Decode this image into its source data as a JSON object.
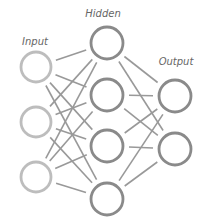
{
  "diagram": {
    "width": 205,
    "height": 224,
    "colors": {
      "background": "#ffffff",
      "label": "#666666",
      "edge": "#999999",
      "input_node_stroke": "#bdbdbd",
      "hidden_node_stroke": "#8a8a8a",
      "output_node_stroke": "#8a8a8a"
    },
    "layers": [
      {
        "id": "input",
        "label": "Input",
        "label_pos": {
          "x": 35,
          "y": 45
        },
        "node_radius": 15,
        "stroke_key": "input_node_stroke",
        "nodes": [
          {
            "x": 36,
            "y": 67
          },
          {
            "x": 36,
            "y": 122
          },
          {
            "x": 36,
            "y": 177
          }
        ]
      },
      {
        "id": "hidden",
        "label": "Hidden",
        "label_pos": {
          "x": 103,
          "y": 17
        },
        "node_radius": 16,
        "stroke_key": "hidden_node_stroke",
        "nodes": [
          {
            "x": 107,
            "y": 43
          },
          {
            "x": 107,
            "y": 95
          },
          {
            "x": 107,
            "y": 146
          },
          {
            "x": 107,
            "y": 199
          }
        ]
      },
      {
        "id": "output",
        "label": "Output",
        "label_pos": {
          "x": 176,
          "y": 65
        },
        "node_radius": 16,
        "stroke_key": "output_node_stroke",
        "nodes": [
          {
            "x": 175,
            "y": 96
          },
          {
            "x": 175,
            "y": 149
          }
        ]
      }
    ],
    "connections": "fully-connected",
    "edge_gap": 6
  }
}
